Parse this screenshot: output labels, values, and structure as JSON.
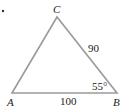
{
  "figure": {
    "type": "triangle",
    "bullet": "•",
    "vertices": [
      {
        "name": "A",
        "x": 12,
        "y": 93
      },
      {
        "name": "B",
        "x": 117,
        "y": 93
      },
      {
        "name": "C",
        "x": 57,
        "y": 17
      }
    ],
    "labels": {
      "A": "A",
      "B": "B",
      "C": "C"
    },
    "sides": {
      "AB": "100",
      "BC": "90"
    },
    "angles": {
      "B": "55°"
    },
    "stroke_color": "#9a9a9a"
  }
}
